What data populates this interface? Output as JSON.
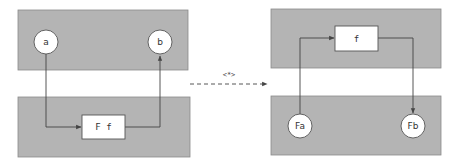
{
  "diagram": {
    "left": {
      "top_panel": {
        "nodes": [
          {
            "id": "a",
            "label": "a"
          },
          {
            "id": "b",
            "label": "b"
          }
        ]
      },
      "bottom_panel": {
        "box_label": "F f"
      }
    },
    "transform_arrow": {
      "label": "<*>"
    },
    "right": {
      "top_panel": {
        "box_label": "f"
      },
      "bottom_panel": {
        "nodes": [
          {
            "id": "Fa",
            "label": "Fa"
          },
          {
            "id": "Fb",
            "label": "Fb"
          }
        ]
      }
    },
    "colors": {
      "panel_fill": "#b4b4b4",
      "node_fill": "#ffffff",
      "stroke": "#444444"
    }
  }
}
